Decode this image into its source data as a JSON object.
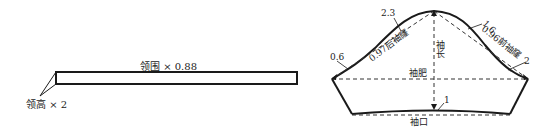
{
  "collar": {
    "length_label": "领围 × 0.88",
    "height_label": "领高 × 2"
  },
  "sleeve": {
    "sleeve_length_label": "袖长",
    "bicep_label": "袖肥",
    "cuff_label": "袖口",
    "back_armhole_label": "0.97后袖窿",
    "front_armhole_label": "0.96前袖窿",
    "offsets": {
      "back_upper": "2.3",
      "back_lower": "0.6",
      "front_upper": "1.6",
      "front_lower": "2",
      "cuff": "1"
    }
  },
  "colors": {
    "line": "#1a1a1a",
    "dashed": "#333333"
  }
}
